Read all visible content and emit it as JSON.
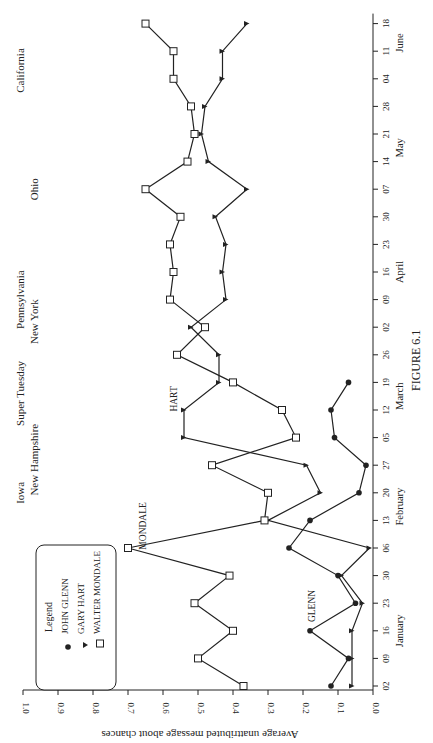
{
  "figure": {
    "caption": "FIGURE 6.1"
  },
  "chart_data": {
    "type": "line",
    "title": "",
    "caption": "FIGURE 6.1",
    "orientation": "rotated 90 degrees (dates run vertically, values horizontally)",
    "xlabel": "",
    "ylabel": "Average unattributed message about chances",
    "ylim": [
      0.0,
      1.0
    ],
    "yticks": [
      "0.0",
      "0.1",
      "0.2",
      "0.3",
      "0.4",
      "0.5",
      "0.6",
      "0.7",
      "0.8",
      "0.9",
      "1.0"
    ],
    "x": [
      "Jan 02",
      "Jan 09",
      "Jan 16",
      "Jan 23",
      "Jan 30",
      "Feb 06",
      "Feb 13",
      "Feb 20",
      "Feb 27",
      "Mar 05",
      "Mar 12",
      "Mar 19",
      "Mar 26",
      "Apr 02",
      "Apr 09",
      "Apr 16",
      "Apr 23",
      "Apr 30",
      "May 07",
      "May 14",
      "May 21",
      "May 28",
      "Jun 04",
      "Jun 11",
      "Jun 18"
    ],
    "xtick_labels": [
      "02",
      "09",
      "16",
      "23",
      "30",
      "06",
      "13",
      "20",
      "27",
      "05",
      "12",
      "19",
      "26",
      "02",
      "09",
      "16",
      "23",
      "30",
      "07",
      "14",
      "21",
      "28",
      "04",
      "11",
      "18"
    ],
    "months": [
      {
        "label": "January",
        "at_index": 2
      },
      {
        "label": "February",
        "at_index": 6.5
      },
      {
        "label": "March",
        "at_index": 10.5
      },
      {
        "label": "April",
        "at_index": 15
      },
      {
        "label": "May",
        "at_index": 19.5
      },
      {
        "label": "June",
        "at_index": 23.3
      }
    ],
    "series": [
      {
        "name": "John Glenn",
        "marker": "circle-filled",
        "values": [
          0.12,
          0.07,
          0.18,
          0.05,
          0.1,
          0.24,
          0.18,
          0.04,
          0.02,
          0.11,
          0.12,
          0.07,
          null,
          null,
          null,
          null,
          null,
          null,
          null,
          null,
          null,
          null,
          null,
          null,
          null
        ]
      },
      {
        "name": "Gary Hart",
        "marker": "triangle-filled",
        "values": [
          0.06,
          0.06,
          0.06,
          0.03,
          0.09,
          0.01,
          0.3,
          0.15,
          0.19,
          0.54,
          0.54,
          0.44,
          0.44,
          0.52,
          0.42,
          0.43,
          0.42,
          0.45,
          0.36,
          0.47,
          0.49,
          0.48,
          0.43,
          0.43,
          0.36
        ]
      },
      {
        "name": "Walter Mondale",
        "marker": "square-open",
        "values": [
          0.37,
          0.5,
          0.4,
          0.51,
          0.41,
          0.7,
          0.31,
          0.3,
          0.46,
          0.22,
          0.26,
          0.4,
          0.56,
          0.48,
          0.58,
          0.57,
          0.58,
          0.55,
          0.65,
          0.53,
          0.51,
          0.52,
          0.57,
          0.57,
          0.65
        ]
      }
    ],
    "legend": {
      "title": "Legend",
      "entries": [
        "John Glenn",
        "Gary Hart",
        "Walter Mondale"
      ],
      "position": "lower-left (rotated)"
    },
    "annotations": [
      {
        "text": "Glenn",
        "near": "Jan 16-23"
      },
      {
        "text": "Mondale",
        "near": "Feb 06"
      },
      {
        "text": "Hart",
        "near": "Mar 05-12"
      }
    ],
    "events": [
      {
        "text": "Iowa",
        "at_index": 7
      },
      {
        "text": "New Hampshire",
        "at_index": 8.2
      },
      {
        "text": "Super Tuesday",
        "at_index": 10.6
      },
      {
        "text": "Pennsylvania",
        "at_index": 14
      },
      {
        "text": "New York",
        "at_index": 13.2
      },
      {
        "text": "Ohio",
        "at_index": 18
      },
      {
        "text": "California",
        "at_index": 22.3
      }
    ],
    "grid": false
  }
}
